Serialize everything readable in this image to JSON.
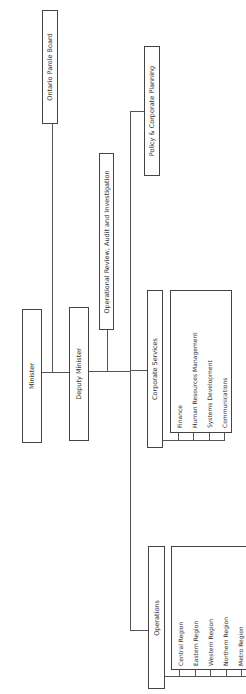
{
  "chart": {
    "orientation": "rotated-90-ccw",
    "nodes": {
      "minister": "Minister",
      "parole_board": "Ontario Parole Board",
      "deputy_minister": "Deputy Minister",
      "operational_review": "Operational Review, Audit and Investigation",
      "policy": "Policy & Corporate Planning",
      "corporate_services": {
        "title": "Corporate Services",
        "units": [
          "Finance",
          "Human Resources Management",
          "Systems Development",
          "Communications"
        ]
      },
      "operations": {
        "title": "Operations",
        "units": [
          "Central Region",
          "Eastern Region",
          "Western Region",
          "Northern Region",
          "Metro Region"
        ]
      }
    }
  }
}
